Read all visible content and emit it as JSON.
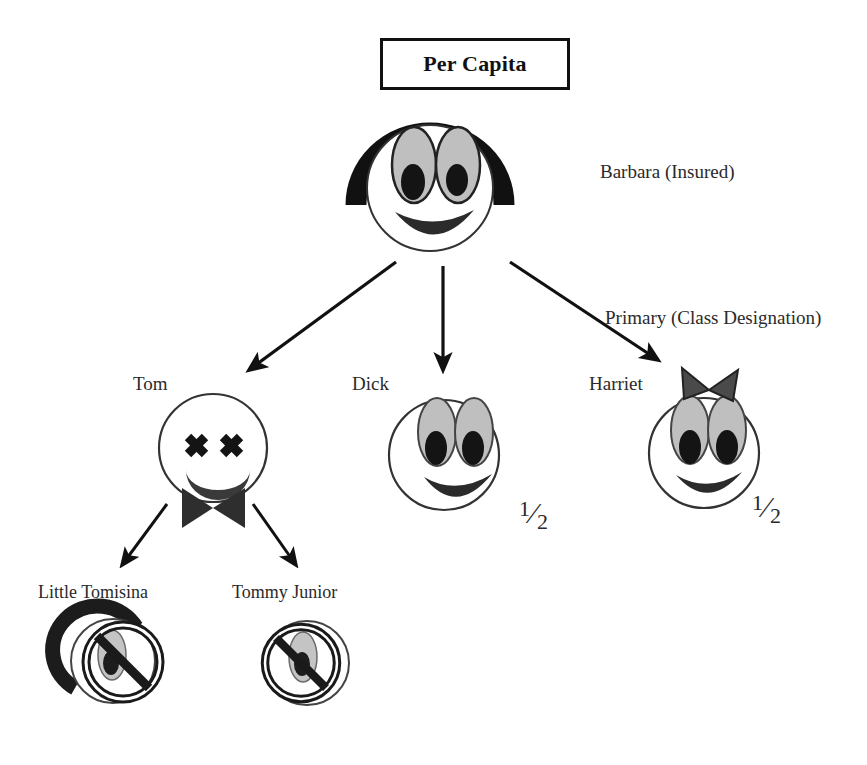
{
  "diagram": {
    "title": "Per Capita",
    "background_color": "#ffffff",
    "ink_color": "#111111",
    "eye_fill_color": "#bfbfbf",
    "mouth_color": "#333333"
  },
  "nodes": {
    "root": {
      "name": "Barbara",
      "label": "Barbara (Insured)",
      "state": "alive",
      "face": "smiling-with-hair"
    },
    "children": [
      {
        "name": "Tom",
        "label": "Tom",
        "state": "deceased",
        "face": "x-eyes-frown-bowtie",
        "share": ""
      },
      {
        "name": "Dick",
        "label": "Dick",
        "state": "alive",
        "face": "smiling",
        "share": "1/2",
        "share_numerator": "1",
        "share_denominator": "2"
      },
      {
        "name": "Harriet",
        "label": "Harriet",
        "state": "alive",
        "face": "smiling-with-bow",
        "share": "1/2",
        "share_numerator": "1",
        "share_denominator": "2"
      }
    ],
    "grandchildren": [
      {
        "name": "Little Tomisina",
        "label": "Little Tomisina",
        "state": "excluded",
        "face": "barred-with-hair",
        "share": ""
      },
      {
        "name": "Tommy Junior",
        "label": "Tommy Junior",
        "state": "excluded",
        "face": "barred",
        "share": ""
      }
    ]
  },
  "annotations": {
    "class_designation": "Primary (Class Designation)"
  }
}
